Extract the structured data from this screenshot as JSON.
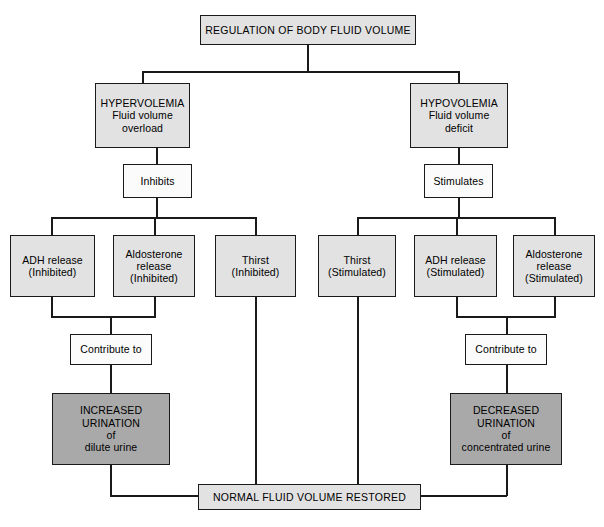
{
  "diagram": {
    "title_node": {
      "label": "REGULATION OF BODY FLUID VOLUME"
    },
    "branches": {
      "left": {
        "condition": {
          "line1": "HYPERVOLEMIA",
          "line2": "Fluid volume",
          "line3": "overload"
        },
        "action": {
          "label": "Inhibits"
        },
        "effects": [
          {
            "line1": "ADH release",
            "line2": "(Inhibited)"
          },
          {
            "line1": "Aldosterone",
            "line2": "release",
            "line3": "(Inhibited)"
          },
          {
            "line1": "Thirst",
            "line2": "(Inhibited)"
          }
        ],
        "connector": {
          "label": "Contribute to"
        },
        "result": {
          "line1": "INCREASED",
          "line2": "URINATION",
          "line3": "of",
          "line4": "dilute urine"
        }
      },
      "right": {
        "condition": {
          "line1": "HYPOVOLEMIA",
          "line2": "Fluid volume",
          "line3": "deficit"
        },
        "action": {
          "label": "Stimulates"
        },
        "effects": [
          {
            "line1": "Thirst",
            "line2": "(Stimulated)"
          },
          {
            "line1": "ADH release",
            "line2": "(Stimulated)"
          },
          {
            "line1": "Aldosterone",
            "line2": "release",
            "line3": "(Stimulated)"
          }
        ],
        "connector": {
          "label": "Contribute to"
        },
        "result": {
          "line1": "DECREASED",
          "line2": "URINATION",
          "line3": "of",
          "line4": "concentrated urine"
        }
      }
    },
    "outcome_node": {
      "label": "NORMAL FLUID VOLUME RESTORED"
    },
    "colors": {
      "node_fill": "#e2e2e2",
      "result_fill": "#a9a9a9",
      "connector_fill": "#fbfbfb",
      "stroke": "#1a1a1a",
      "text": "#000000",
      "background": "#ffffff"
    }
  }
}
